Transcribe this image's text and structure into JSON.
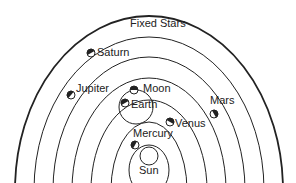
{
  "diagram": {
    "labels": {
      "fixed_stars": "Fixed Stars",
      "saturn": "Saturn",
      "jupiter": "Jupiter",
      "moon": "Moon",
      "earth": "Earth",
      "mars": "Mars",
      "venus": "Venus",
      "mercury": "Mercury",
      "sun": "Sun"
    },
    "colors": {
      "line": "#222222",
      "background": "#ffffff"
    }
  }
}
